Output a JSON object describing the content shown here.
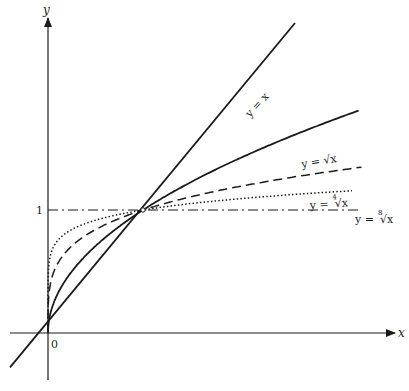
{
  "chart_data": {
    "type": "line",
    "title": "",
    "xlabel": "x",
    "ylabel": "y",
    "origin_label": "0",
    "y_tick_labels": [
      "1"
    ],
    "reference_line": {
      "y": 1,
      "style": "dash-dot"
    },
    "intersection_point": [
      1,
      1
    ],
    "grid": false,
    "legend": "inline curve labels",
    "series": [
      {
        "name": "y = x",
        "label": "y = x",
        "function": "x",
        "style": "solid"
      },
      {
        "name": "y = √x",
        "label": "y = √x",
        "function": "x^(1/2)",
        "style": "solid"
      },
      {
        "name": "y = ⁴√x",
        "label": "y = ⁴√x",
        "function": "x^(1/4)",
        "style": "dashed"
      },
      {
        "name": "y = ⁸√x",
        "label": "y = ⁸√x",
        "function": "x^(1/8)",
        "style": "dotted"
      }
    ],
    "xlim": [
      -0.4,
      3.3
    ],
    "ylim": [
      -0.3,
      2.5
    ]
  },
  "labels": {
    "x_axis": "x",
    "y_axis": "y",
    "origin": "0",
    "one": "1",
    "line": "y = x",
    "sqrt": "y = √x",
    "sqrt_prefix": "y = ",
    "root4_index": "4",
    "root8_index": "8",
    "radical": "√x"
  }
}
